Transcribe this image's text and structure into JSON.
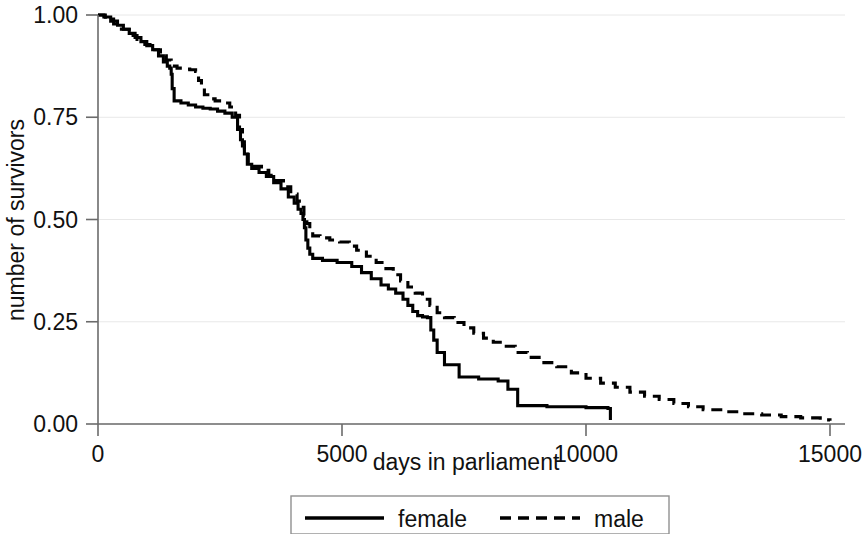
{
  "chart_data": {
    "type": "line",
    "title": "",
    "subtitle": "",
    "xlabel": "days in parliament",
    "ylabel": "number of survivors",
    "xlim": [
      0,
      15000
    ],
    "ylim": [
      0,
      1.0
    ],
    "xticks": [
      0,
      5000,
      10000,
      15000
    ],
    "xtick_labels": [
      "0",
      "5000",
      "10000",
      "15000"
    ],
    "yticks": [
      0.0,
      0.25,
      0.5,
      0.75,
      1.0
    ],
    "ytick_labels": [
      "0.00",
      "0.25",
      "0.50",
      "0.75",
      "1.00"
    ],
    "grid": "horizontal",
    "legend_position": "bottom-center",
    "step_type": "post",
    "series": [
      {
        "name": "female",
        "style": "solid",
        "color": "#000000",
        "x": [
          0,
          120,
          260,
          400,
          520,
          640,
          760,
          880,
          1000,
          1120,
          1240,
          1340,
          1420,
          1470,
          1500,
          1520,
          1560,
          1700,
          1850,
          2000,
          2150,
          2300,
          2450,
          2600,
          2750,
          2860,
          2920,
          2960,
          3000,
          3060,
          3150,
          3300,
          3450,
          3600,
          3750,
          3900,
          4020,
          4100,
          4160,
          4200,
          4230,
          4260,
          4300,
          4340,
          4400,
          4600,
          4900,
          5200,
          5400,
          5600,
          5800,
          5950,
          6100,
          6250,
          6350,
          6450,
          6550,
          6650,
          6750,
          6820,
          6880,
          6950,
          7100,
          7400,
          7800,
          8200,
          8400,
          8600,
          9200,
          10000,
          10450,
          10500
        ],
        "y": [
          1.0,
          0.995,
          0.985,
          0.975,
          0.965,
          0.955,
          0.945,
          0.935,
          0.925,
          0.915,
          0.9,
          0.885,
          0.875,
          0.87,
          0.855,
          0.82,
          0.79,
          0.785,
          0.78,
          0.775,
          0.772,
          0.77,
          0.765,
          0.76,
          0.75,
          0.72,
          0.695,
          0.68,
          0.66,
          0.635,
          0.625,
          0.615,
          0.605,
          0.59,
          0.575,
          0.555,
          0.54,
          0.525,
          0.515,
          0.5,
          0.48,
          0.45,
          0.43,
          0.415,
          0.405,
          0.4,
          0.395,
          0.385,
          0.37,
          0.355,
          0.34,
          0.33,
          0.32,
          0.305,
          0.29,
          0.275,
          0.265,
          0.262,
          0.26,
          0.23,
          0.205,
          0.175,
          0.145,
          0.115,
          0.11,
          0.105,
          0.085,
          0.045,
          0.042,
          0.04,
          0.038,
          0.01
        ],
        "end_x": 10500,
        "end_y": 0.01
      },
      {
        "name": "male",
        "style": "dashed",
        "color": "#000000",
        "x": [
          0,
          150,
          320,
          480,
          640,
          800,
          960,
          1120,
          1280,
          1400,
          1500,
          1620,
          1750,
          1880,
          2000,
          2060,
          2120,
          2180,
          2250,
          2400,
          2550,
          2700,
          2820,
          2900,
          2960,
          3000,
          3080,
          3200,
          3350,
          3500,
          3650,
          3800,
          3950,
          4080,
          4160,
          4220,
          4280,
          4340,
          4400,
          4550,
          4750,
          4950,
          5150,
          5300,
          5500,
          5700,
          5900,
          6050,
          6200,
          6350,
          6500,
          6650,
          6800,
          6950,
          7100,
          7300,
          7500,
          7700,
          7900,
          8100,
          8300,
          8550,
          8800,
          9100,
          9400,
          9700,
          10000,
          10300,
          10600,
          10900,
          11200,
          11500,
          11800,
          12100,
          12400,
          12800,
          13200,
          13600,
          14000,
          14400,
          14800,
          15000
        ],
        "y": [
          1.0,
          0.99,
          0.978,
          0.965,
          0.95,
          0.94,
          0.928,
          0.915,
          0.9,
          0.89,
          0.875,
          0.87,
          0.868,
          0.866,
          0.862,
          0.84,
          0.82,
          0.805,
          0.795,
          0.79,
          0.785,
          0.775,
          0.755,
          0.72,
          0.69,
          0.665,
          0.64,
          0.63,
          0.62,
          0.608,
          0.595,
          0.58,
          0.562,
          0.545,
          0.53,
          0.51,
          0.49,
          0.47,
          0.46,
          0.455,
          0.45,
          0.445,
          0.435,
          0.425,
          0.41,
          0.395,
          0.38,
          0.365,
          0.35,
          0.335,
          0.32,
          0.305,
          0.29,
          0.272,
          0.26,
          0.248,
          0.235,
          0.222,
          0.21,
          0.2,
          0.19,
          0.175,
          0.163,
          0.15,
          0.14,
          0.125,
          0.112,
          0.1,
          0.09,
          0.078,
          0.068,
          0.06,
          0.05,
          0.042,
          0.035,
          0.03,
          0.025,
          0.022,
          0.018,
          0.015,
          0.01,
          0.008
        ],
        "end_x": 15000,
        "end_y": 0.008
      }
    ]
  },
  "legend": {
    "items": [
      {
        "label": "female",
        "style": "solid"
      },
      {
        "label": "male",
        "style": "dashed"
      }
    ]
  },
  "axes": {
    "x_title": "days in parliament",
    "y_title": "number of survivors"
  }
}
